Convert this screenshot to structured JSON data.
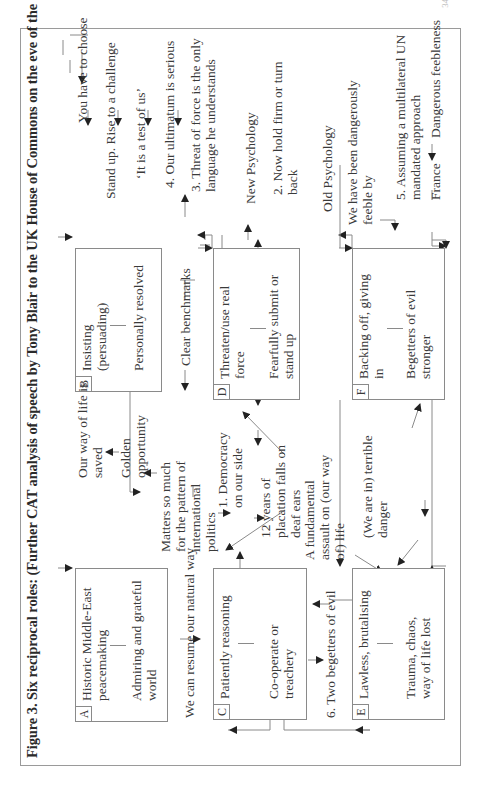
{
  "page_number": "347",
  "figure": {
    "caption": "Figure 3.  Six reciprocal roles: (Further CAT analysis of speech by Tony Blair to the UK House of Commons on the eve of the Iraq war)"
  },
  "boxes": [
    {
      "id": "A",
      "role": "Historic Middle-East peacemaking",
      "reciprocal": "Admiring and grateful world"
    },
    {
      "id": "B",
      "role": "Insisting (persuading)",
      "reciprocal": "Personally resolved"
    },
    {
      "id": "C",
      "role": "Patiently reasoning",
      "reciprocal": "Co-operate or treachery"
    },
    {
      "id": "D",
      "role": "Threaten/use real force",
      "reciprocal": "Fearfully submit or stand up"
    },
    {
      "id": "E",
      "role": "Lawless, brutalising",
      "reciprocal": "Trauma, chaos, way of life lost"
    },
    {
      "id": "F",
      "role": "Backing off, giving in",
      "reciprocal": "Begetters of evil stronger"
    }
  ],
  "labels": {
    "you_have_to_choose": "You have to choose",
    "stand_up": "Stand up. Rise to a challenge",
    "test_of_us": "‘It is a test of us’",
    "ultimatum": "4.  Our ultimatum is serious",
    "threat_of_force": "3.  Threat of force is the only language he understands",
    "new_psychology": "New Psychology",
    "hold_firm": "2.  Now hold firm or turn back",
    "old_psychology": "Old Psychology",
    "dangerously_feeble": "We have been dangerously feeble by",
    "multilateral": "5.  Assuming a multilateral UN mandated approach",
    "france": "France",
    "dangerous_feebleness": "Dangerous feebleness",
    "way_of_life_saved": "Our way of life is saved",
    "golden_opportunity": "Golden opportunity",
    "clear_benchmarks": "Clear benchmarks",
    "matters_so_much": "Matters so much for the pattern of international politics",
    "democracy": "1.  Democracy on our side",
    "placation": "12 years of placation falls on deaf ears",
    "fundamental_assault": "A fundamental assault on (our way of) life",
    "terrible_danger": "(We are in) terrible danger",
    "resume_natural_way": "We can resume our natural way",
    "two_begetters": "6.  Two begetters of evil"
  }
}
